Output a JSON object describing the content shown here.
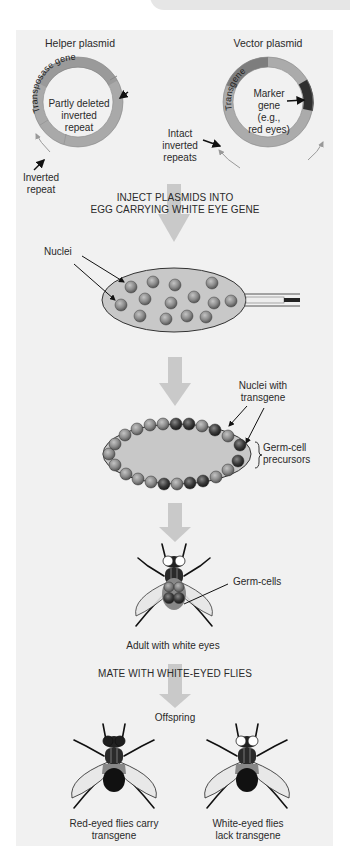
{
  "colors": {
    "panel_bg": "#f1f1f1",
    "plasmid_ring": "#a9a9a9",
    "transgene_segment": "#7d7d7d",
    "marker_segment": "#2f2f2f",
    "flow_arrow": "#c9c9c9",
    "nucleus": "#8a8a8a",
    "nucleus_transgene": "#3a3a3a",
    "egg_fill": "#c8c8c8"
  },
  "plasmids": {
    "helper": {
      "title": "Helper plasmid",
      "segment_label": "Transposase gene",
      "inner_label_lines": [
        "Partly deleted",
        "inverted",
        "repeat"
      ],
      "outer_label_lines": [
        "Inverted",
        "repeat"
      ]
    },
    "vector": {
      "title": "Vector plasmid",
      "segment_label": "Transgene",
      "inner_label_lines": [
        "Marker",
        "gene",
        "(e.g.,",
        "red eyes)"
      ],
      "outer_label_lines": [
        "Intact",
        "inverted",
        "repeats"
      ]
    }
  },
  "steps": {
    "inject_lines": [
      "INJECT PLASMIDS INTO",
      "EGG CARRYING WHITE EYE GENE"
    ],
    "nuclei_label": "Nuclei",
    "transgene_nuclei_lines": [
      "Nuclei with",
      "transgene"
    ],
    "germ_precursor_lines": [
      "Germ-cell",
      "precursors"
    ],
    "germ_cells_label": "Germ-cells",
    "adult_label": "Adult with white eyes",
    "mate_label": "MATE WITH WHITE-EYED FLIES",
    "offspring_label": "Offspring"
  },
  "offspring": [
    {
      "label_lines": [
        "Red-eyed flies carry",
        "transgene"
      ],
      "eye_color": "#1e1e1e"
    },
    {
      "label_lines": [
        "White-eyed flies",
        "lack transgene"
      ],
      "eye_color": "#ffffff"
    }
  ]
}
